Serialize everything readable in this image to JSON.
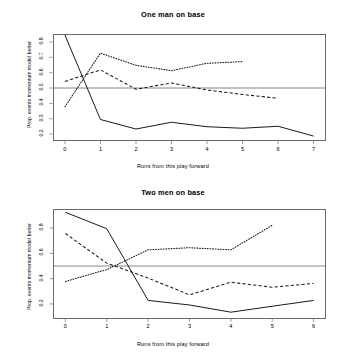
{
  "figure": {
    "background": "#ffffff",
    "line_color": "#1a1a1a",
    "axis_color": "#6b6b6b",
    "ref_line_color": "#555555"
  },
  "charts": [
    {
      "id": "one-man-on-base",
      "title": "One man on base",
      "xlabel": "Runs from this play forward",
      "ylabel": "Prop. events momentum model better",
      "xticks": [
        "0",
        "1",
        "2",
        "3",
        "4",
        "5",
        "6",
        "7"
      ],
      "yticks": [
        "0.2",
        "0.3",
        "0.4",
        "0.5",
        "0.6",
        "0.7",
        "0.8"
      ],
      "xlim": [
        -0.35,
        7.35
      ],
      "ylim": [
        0.155,
        0.855
      ],
      "reference_line_y": 0.5
    },
    {
      "id": "two-men-on-base",
      "title": "Two men on base",
      "xlabel": "Runs from this play forward",
      "ylabel": "Prop. events momentum model better",
      "xticks": [
        "0",
        "1",
        "2",
        "3",
        "4",
        "5",
        "6"
      ],
      "yticks": [
        "0.2",
        "0.4",
        "0.6",
        "0.8"
      ],
      "xlim": [
        -0.3,
        6.3
      ],
      "ylim": [
        0.085,
        0.955
      ],
      "reference_line_y": 0.5
    }
  ],
  "chart_data": [
    {
      "type": "line",
      "title": "One man on base",
      "xlabel": "Runs from this play forward",
      "ylabel": "Prop. events momentum model better",
      "xlim": [
        -0.35,
        7.35
      ],
      "ylim": [
        0.155,
        0.855
      ],
      "grid": false,
      "legend": "none",
      "xticks": [
        0,
        1,
        2,
        3,
        4,
        5,
        6,
        7
      ],
      "yticks": [
        0.2,
        0.3,
        0.4,
        0.5,
        0.6,
        0.7,
        0.8
      ],
      "annotations": [
        {
          "type": "hline",
          "y": 0.5,
          "style": "solid-thin"
        }
      ],
      "series": [
        {
          "name": "solid",
          "style": "solid",
          "x": [
            0,
            1,
            2,
            3,
            4,
            5,
            6,
            7
          ],
          "values": [
            0.845,
            0.295,
            0.233,
            0.277,
            0.248,
            0.238,
            0.251,
            0.187
          ]
        },
        {
          "name": "dashed",
          "style": "dashed",
          "x": [
            0,
            1,
            2,
            3,
            4,
            5,
            6
          ],
          "values": [
            0.543,
            0.618,
            0.492,
            0.533,
            0.487,
            0.458,
            0.433
          ]
        },
        {
          "name": "dotted",
          "style": "dotted",
          "x": [
            0,
            1,
            2,
            3,
            4,
            5
          ],
          "values": [
            0.378,
            0.727,
            0.648,
            0.613,
            0.661,
            0.672
          ]
        }
      ]
    },
    {
      "type": "line",
      "title": "Two men on base",
      "xlabel": "Runs from this play forward",
      "ylabel": "Prop. events momentum model better",
      "xlim": [
        -0.3,
        6.3
      ],
      "ylim": [
        0.085,
        0.955
      ],
      "grid": false,
      "legend": "none",
      "xticks": [
        0,
        1,
        2,
        3,
        4,
        5,
        6
      ],
      "yticks": [
        0.2,
        0.4,
        0.6,
        0.8
      ],
      "annotations": [
        {
          "type": "hline",
          "y": 0.5,
          "style": "solid-thin"
        }
      ],
      "series": [
        {
          "name": "solid",
          "style": "solid",
          "x": [
            0,
            1,
            2,
            3,
            4,
            5,
            6
          ],
          "values": [
            0.925,
            0.795,
            0.228,
            0.192,
            0.135,
            0.182,
            0.228
          ]
        },
        {
          "name": "dashed",
          "style": "dashed",
          "x": [
            0,
            1,
            2,
            3,
            4,
            5,
            6
          ],
          "values": [
            0.757,
            0.523,
            0.405,
            0.272,
            0.372,
            0.332,
            0.363
          ]
        },
        {
          "name": "dotted",
          "style": "dotted",
          "x": [
            0,
            1,
            2,
            3,
            4,
            5
          ],
          "values": [
            0.378,
            0.472,
            0.628,
            0.645,
            0.628,
            0.822
          ]
        }
      ]
    }
  ]
}
